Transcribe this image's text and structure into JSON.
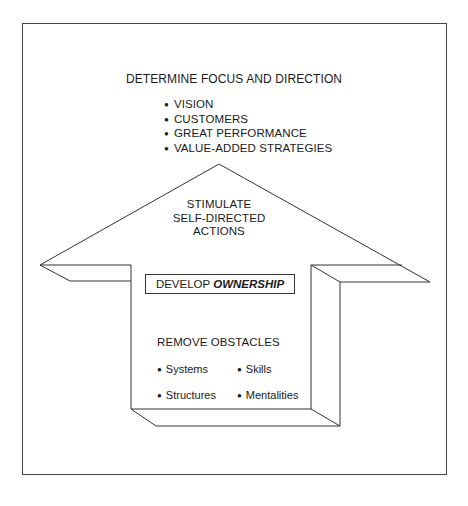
{
  "diagram": {
    "top": {
      "heading": "DETERMINE FOCUS AND DIRECTION",
      "items": [
        "VISION",
        "CUSTOMERS",
        "GREAT PERFORMANCE",
        "VALUE-ADDED STRATEGIES"
      ]
    },
    "arrow_head": {
      "lines": [
        "STIMULATE",
        "SELF-DIRECTED",
        "ACTIONS"
      ]
    },
    "center_box": {
      "prefix": "DEVELOP",
      "emphasis": "OWNERSHIP"
    },
    "base": {
      "heading": "REMOVE OBSTACLES",
      "items": [
        "Systems",
        "Skills",
        "Structures",
        "Mentalities"
      ]
    },
    "colors": {
      "line": "#333333",
      "background": "#ffffff"
    }
  }
}
